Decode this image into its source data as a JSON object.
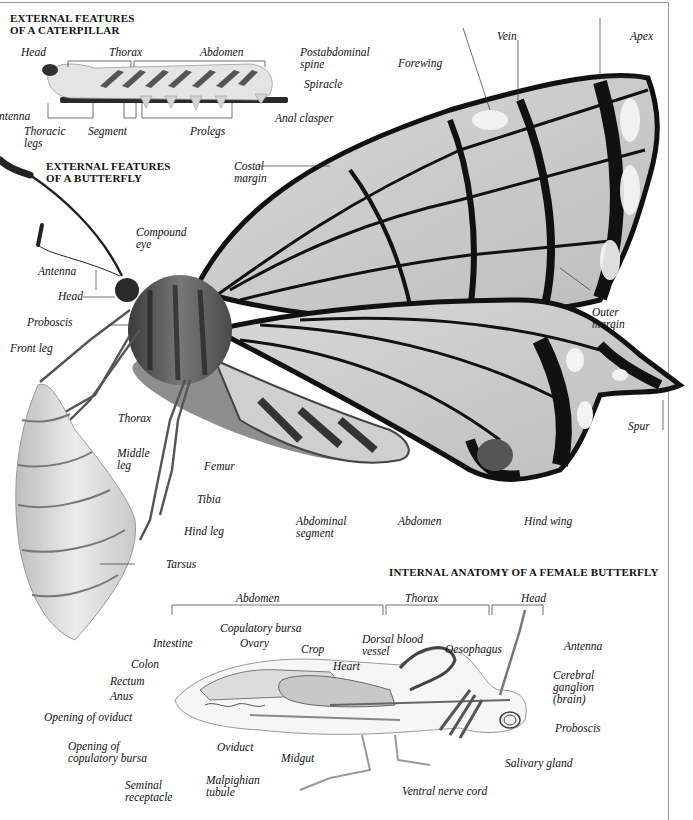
{
  "caterpillar": {
    "heading": "EXTERNAL FEATURES\nOF A CATERPILLAR",
    "labels": {
      "head": "Head",
      "thorax": "Thorax",
      "abdomen": "Abdomen",
      "postabdominal_spine": "Postabdominal\nspine",
      "spiracle": "Spiracle",
      "antenna": "Antenna",
      "anal_clasper": "Anal clasper",
      "thoracic_legs": "Thoracic\nlegs",
      "segment": "Segment",
      "prolegs": "Prolegs"
    }
  },
  "butterfly": {
    "heading": "EXTERNAL FEATURES\nOF A BUTTERFLY",
    "labels": {
      "vein": "Vein",
      "apex": "Apex",
      "forewing": "Forewing",
      "costal_margin": "Costal\nmargin",
      "compound_eye": "Compound\neye",
      "antenna": "Antenna",
      "head": "Head",
      "proboscis": "Proboscis",
      "front_leg": "Front leg",
      "outer_margin": "Outer\nmargin",
      "thorax": "Thorax",
      "middle_leg": "Middle\nleg",
      "femur": "Femur",
      "spur": "Spur",
      "tibia": "Tibia",
      "hind_leg": "Hind leg",
      "abdominal_segment": "Abdominal\nsegment",
      "abdomen": "Abdomen",
      "hind_wing": "Hind wing",
      "tarsus": "Tarsus"
    }
  },
  "internal": {
    "heading": "INTERNAL ANATOMY OF A FEMALE BUTTERFLY",
    "regions": {
      "abdomen": "Abdomen",
      "thorax": "Thorax",
      "head": "Head"
    },
    "labels": {
      "copulatory_bursa": "Copulatory bursa",
      "intestine": "Intestine",
      "ovary": "Ovary",
      "crop": "Crop",
      "dorsal_blood_vessel": "Dorsal blood\nvessel",
      "oesophagus": "Oesophagus",
      "antenna": "Antenna",
      "colon": "Colon",
      "heart": "Heart",
      "cerebral_ganglion": "Cerebral\nganglion\n(brain)",
      "rectum": "Rectum",
      "anus": "Anus",
      "opening_of_oviduct": "Opening of oviduct",
      "proboscis": "Proboscis",
      "opening_of_copulatory_bursa": "Opening of\ncopulatory bursa",
      "oviduct": "Oviduct",
      "midgut": "Midgut",
      "salivary_gland": "Salivary gland",
      "seminal_receptacle": "Seminal\nreceptacle",
      "malpighian_tubule": "Malpighian\ntubule",
      "ventral_nerve_cord": "Ventral nerve cord"
    }
  }
}
